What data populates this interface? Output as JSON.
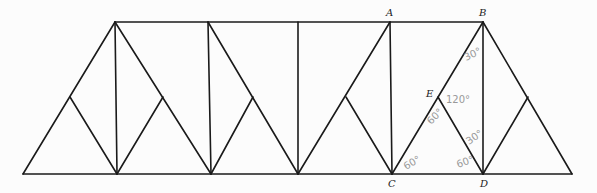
{
  "diagram": {
    "type": "truss",
    "nodes": {
      "A": {
        "label": "A"
      },
      "B": {
        "label": "B"
      },
      "C": {
        "label": "C"
      },
      "D": {
        "label": "D"
      },
      "E": {
        "label": "E"
      }
    },
    "angles": [
      {
        "id": "angle-B",
        "text": "30°"
      },
      {
        "id": "angle-E-top",
        "text": "120°"
      },
      {
        "id": "angle-E-left",
        "text": "60°"
      },
      {
        "id": "angle-D-upper",
        "text": "30°"
      },
      {
        "id": "angle-D-lower",
        "text": "60°"
      },
      {
        "id": "angle-C",
        "text": "60°"
      }
    ]
  }
}
